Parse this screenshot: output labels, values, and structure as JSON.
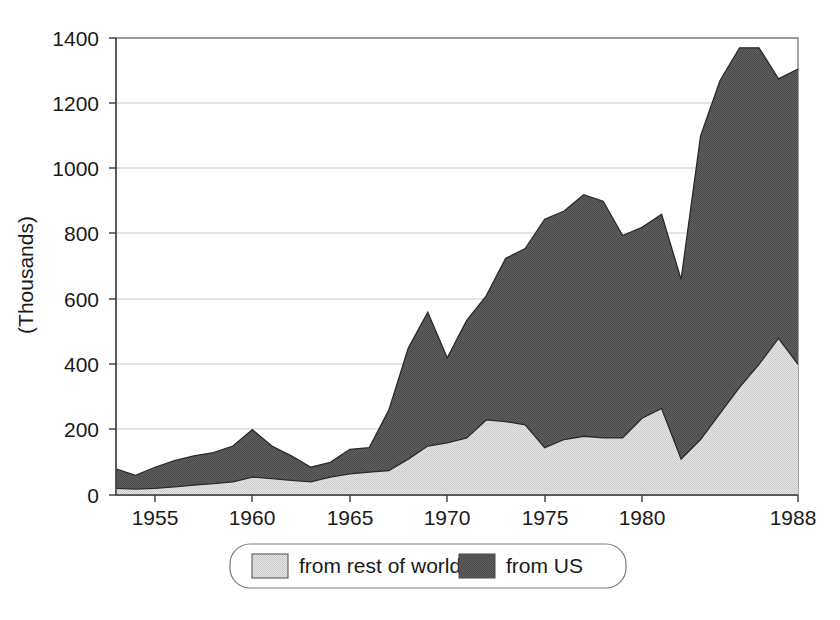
{
  "chart_data": {
    "type": "area",
    "stacked": true,
    "title": "",
    "subtitle": "",
    "xlabel": "",
    "ylabel": "(Thousands)",
    "xlim": [
      1953,
      1988
    ],
    "ylim": [
      0,
      1400
    ],
    "y_ticks": [
      0,
      200,
      400,
      600,
      800,
      1000,
      1200,
      1400
    ],
    "y_tick_labels": [
      "0",
      "200",
      "400",
      "600",
      "800",
      "1000",
      "1200",
      "1400"
    ],
    "x_ticks": [
      1955,
      1960,
      1965,
      1970,
      1975,
      1980,
      1988
    ],
    "x_tick_labels": [
      "1955",
      "1960",
      "1965",
      "1970",
      "1975",
      "1980",
      "1988"
    ],
    "grid": "horizontal",
    "legend_position": "bottom",
    "x": [
      1953,
      1954,
      1955,
      1956,
      1957,
      1958,
      1959,
      1960,
      1961,
      1962,
      1963,
      1964,
      1965,
      1966,
      1967,
      1968,
      1969,
      1970,
      1971,
      1972,
      1973,
      1974,
      1975,
      1976,
      1977,
      1978,
      1979,
      1980,
      1981,
      1982,
      1983,
      1984,
      1985,
      1986,
      1987,
      1988
    ],
    "series": [
      {
        "name": "from rest of world",
        "color": "#dcdcdc",
        "values": [
          20,
          18,
          20,
          25,
          30,
          35,
          40,
          55,
          50,
          45,
          40,
          55,
          65,
          70,
          75,
          110,
          150,
          160,
          175,
          230,
          225,
          215,
          145,
          170,
          180,
          175,
          175,
          235,
          265,
          110,
          170,
          250,
          330,
          400,
          480,
          400
        ]
      },
      {
        "name": "from US",
        "color": "#595959",
        "values": [
          60,
          42,
          65,
          80,
          90,
          95,
          110,
          145,
          100,
          75,
          45,
          45,
          75,
          75,
          185,
          340,
          410,
          260,
          360,
          380,
          500,
          540,
          700,
          700,
          740,
          725,
          620,
          585,
          595,
          550,
          930,
          1020,
          1040,
          970,
          795,
          905
        ]
      }
    ],
    "totals": [
      80,
      60,
      85,
      105,
      120,
      130,
      150,
      200,
      150,
      120,
      85,
      100,
      140,
      145,
      260,
      450,
      560,
      420,
      535,
      610,
      725,
      755,
      845,
      870,
      920,
      900,
      795,
      820,
      860,
      660,
      1100,
      1270,
      1370,
      1370,
      1275,
      1305
    ]
  },
  "legend": {
    "entries": [
      {
        "label": "from rest of world",
        "color": "#dcdcdc"
      },
      {
        "label": "from US",
        "color": "#595959"
      }
    ]
  }
}
